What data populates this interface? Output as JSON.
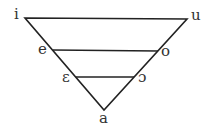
{
  "diagram": {
    "type": "vowel-triangle",
    "vowels": {
      "top_left": "i",
      "top_right": "u",
      "mid_high_left": "e",
      "mid_high_right": "o",
      "mid_low_left": "ɛ",
      "mid_low_right": "ɔ",
      "bottom": "a"
    },
    "colors": {
      "line": "#222222",
      "text": "#333333",
      "background": "#ffffff"
    }
  }
}
